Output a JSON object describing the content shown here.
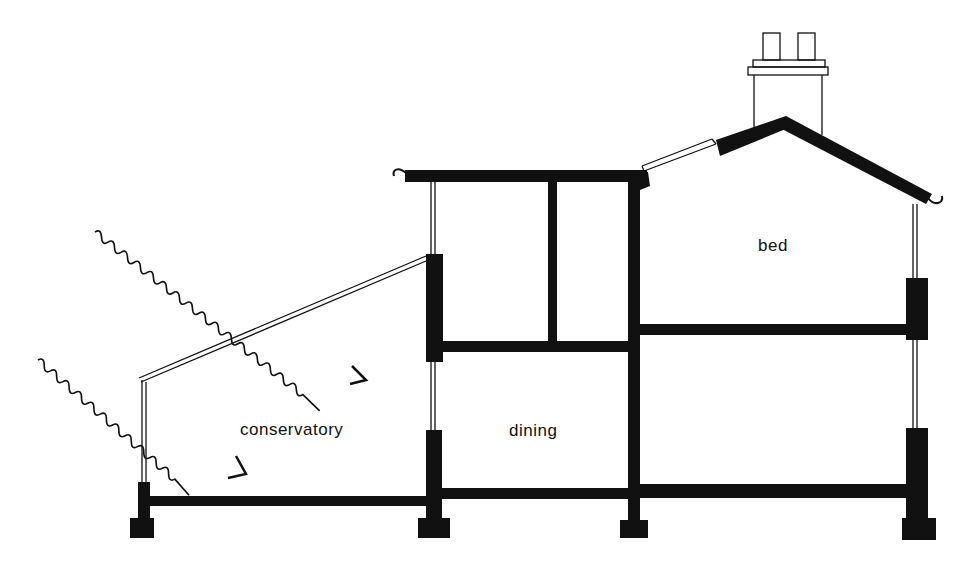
{
  "diagram": {
    "type": "building-section",
    "colors": {
      "ink": "#111111",
      "paper": "#ffffff"
    },
    "rooms": [
      {
        "id": "conservatory",
        "label": "conservatory"
      },
      {
        "id": "dining",
        "label": "dining"
      },
      {
        "id": "bed",
        "label": "bed"
      }
    ],
    "annotations": [
      {
        "id": "solar-ray-1",
        "type": "wavy-arrow",
        "meaning": "solar radiation"
      },
      {
        "id": "solar-ray-2",
        "type": "wavy-arrow",
        "meaning": "solar radiation"
      }
    ]
  }
}
